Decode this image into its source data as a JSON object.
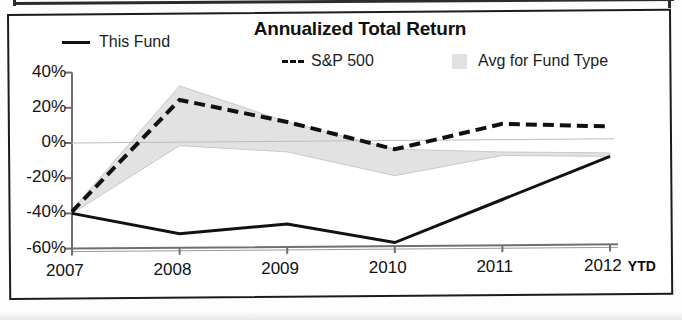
{
  "chart_data": {
    "type": "line",
    "title": "Annualized Total Return",
    "xlabel": "",
    "ylabel": "",
    "grid": false,
    "legend_position": "top",
    "categories": [
      "2007",
      "2008",
      "2009",
      "2010",
      "2011",
      "2012"
    ],
    "x_tick_suffix": "YTD",
    "ylim": [
      -60,
      40
    ],
    "y_ticks": [
      40,
      20,
      0,
      -20,
      -40,
      -60
    ],
    "y_tick_labels": [
      "40%",
      "20%",
      "0%",
      "-20%",
      "-40%",
      "-60%"
    ],
    "series": [
      {
        "name": "This Fund",
        "style": "solid",
        "color": "#111111",
        "values": [
          -40,
          -52,
          -47,
          -58,
          -34,
          -10
        ]
      },
      {
        "name": "S&P 500",
        "style": "dashed",
        "color": "#111111",
        "values": [
          -39,
          24,
          11,
          -5,
          9,
          7
        ]
      },
      {
        "name": "Avg for Fund Type",
        "style": "band",
        "color": "#e2e2e2",
        "upper": [
          -38,
          32,
          11,
          -5,
          -7,
          -8
        ],
        "lower": [
          -40,
          -2,
          -6,
          -20,
          -9,
          -10
        ]
      }
    ],
    "annotations": []
  },
  "legend": {
    "this_fund": "This Fund",
    "sp500": "S&P 500",
    "avg_fund_type": "Avg for Fund Type"
  },
  "colors": {
    "line": "#111111",
    "band": "#e2e2e2",
    "frame": "#1c1c1c",
    "axis": "#6f6f6f"
  }
}
